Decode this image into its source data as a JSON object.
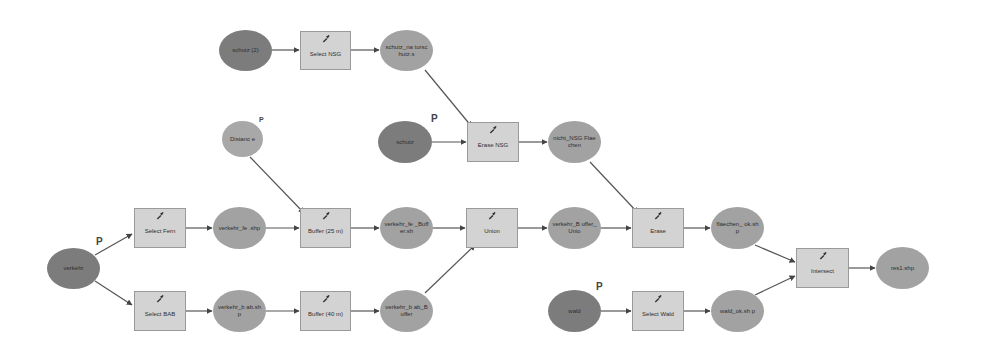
{
  "diagram": {
    "title": "",
    "colors": {
      "input_data": "#7c7c7c",
      "derived_data": "#a2a2a2",
      "tool": "#d3d3d3",
      "edge": "#555555"
    },
    "nodes": {
      "schutz2": {
        "label": "schutz (2)",
        "type": "input_data"
      },
      "select_nsg": {
        "label": "Select NSG",
        "type": "tool"
      },
      "schutz_nsg": {
        "label": "schutz_na turschutz.s",
        "type": "derived_data"
      },
      "schutz": {
        "label": "schutz",
        "type": "input_data",
        "param": "P"
      },
      "erase_nsg": {
        "label": "Erase NSG",
        "type": "tool"
      },
      "nicht_nsg": {
        "label": "nicht_NSG Flaechen",
        "type": "derived_data"
      },
      "distance": {
        "label": "Distanc e",
        "type": "parameter",
        "param": "P"
      },
      "verkehr": {
        "label": "verkehr",
        "type": "input_data",
        "param": "P"
      },
      "select_fern": {
        "label": "Select Fern",
        "type": "tool"
      },
      "verkehr_fe": {
        "label": "verkehr_fe .shp",
        "type": "derived_data"
      },
      "buffer25": {
        "label": "Buffer (25 m)",
        "type": "tool"
      },
      "verkehr_fe_buffer": {
        "label": "verkehr_fe _Buffer.sh",
        "type": "derived_data"
      },
      "union": {
        "label": "Union",
        "type": "tool"
      },
      "verkehr_buffer_union": {
        "label": "verkehr_B uffer_Unio",
        "type": "derived_data"
      },
      "erase": {
        "label": "Erase",
        "type": "tool"
      },
      "flaechen_ok": {
        "label": "flaechen_ ok.shp",
        "type": "derived_data"
      },
      "intersect": {
        "label": "Intersect",
        "type": "tool"
      },
      "res1": {
        "label": "res1.shp",
        "type": "derived_data"
      },
      "select_bab": {
        "label": "Select BAB",
        "type": "tool"
      },
      "verkehr_bab": {
        "label": "verkehr_b ab.shp",
        "type": "derived_data"
      },
      "buffer40": {
        "label": "Buffer (40 m)",
        "type": "tool"
      },
      "verkehr_bab_buffer": {
        "label": "verkehr_b ab_Buffer",
        "type": "derived_data"
      },
      "wald": {
        "label": "wald",
        "type": "input_data",
        "param": "P"
      },
      "select_wald": {
        "label": "Select Wald",
        "type": "tool"
      },
      "wald_ok": {
        "label": "wald_ok.sh p",
        "type": "derived_data"
      }
    },
    "edges": [
      [
        "schutz2",
        "select_nsg"
      ],
      [
        "select_nsg",
        "schutz_nsg"
      ],
      [
        "schutz_nsg",
        "erase_nsg"
      ],
      [
        "schutz",
        "erase_nsg"
      ],
      [
        "erase_nsg",
        "nicht_nsg"
      ],
      [
        "nicht_nsg",
        "erase"
      ],
      [
        "distance",
        "buffer25"
      ],
      [
        "verkehr",
        "select_fern"
      ],
      [
        "verkehr",
        "select_bab"
      ],
      [
        "select_fern",
        "verkehr_fe"
      ],
      [
        "verkehr_fe",
        "buffer25"
      ],
      [
        "buffer25",
        "verkehr_fe_buffer"
      ],
      [
        "verkehr_fe_buffer",
        "union"
      ],
      [
        "union",
        "verkehr_buffer_union"
      ],
      [
        "verkehr_buffer_union",
        "erase"
      ],
      [
        "erase",
        "flaechen_ok"
      ],
      [
        "flaechen_ok",
        "intersect"
      ],
      [
        "intersect",
        "res1"
      ],
      [
        "select_bab",
        "verkehr_bab"
      ],
      [
        "verkehr_bab",
        "buffer40"
      ],
      [
        "buffer40",
        "verkehr_bab_buffer"
      ],
      [
        "verkehr_bab_buffer",
        "union"
      ],
      [
        "wald",
        "select_wald"
      ],
      [
        "select_wald",
        "wald_ok"
      ],
      [
        "wald_ok",
        "intersect"
      ]
    ]
  }
}
